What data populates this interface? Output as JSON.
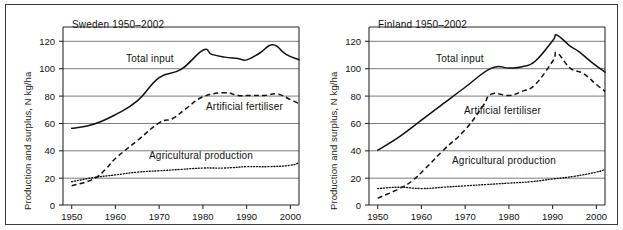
{
  "figure": {
    "background": "#ffffff",
    "frame_color": "#3a3a3a"
  },
  "panels": [
    {
      "id": "sweden",
      "title": "Sweden 1950–2002",
      "ylabel": "Production and surplus, N kg/ha",
      "series_labels": {
        "total_input": "Total input",
        "artificial_fertiliser": "Artificial fertiliser",
        "agricultural_production": "Agricultural production"
      },
      "yticks": [
        "0",
        "20",
        "40",
        "60",
        "80",
        "100",
        "120"
      ],
      "xticks": [
        "1950",
        "1960",
        "1970",
        "1980",
        "1990",
        "2000"
      ]
    },
    {
      "id": "finland",
      "title": "Finland 1950–2002",
      "ylabel": "Production and surplus, N kg/ha",
      "series_labels": {
        "total_input": "Total input",
        "artificial_fertiliser": "Artificial fertiliser",
        "agricultural_production": "Agricultural production"
      },
      "yticks": [
        "0",
        "20",
        "40",
        "60",
        "80",
        "100",
        "120"
      ],
      "xticks": [
        "1950",
        "1960",
        "1970",
        "1980",
        "1990",
        "2000"
      ]
    }
  ],
  "chart_data": [
    {
      "type": "line",
      "title": "Sweden 1950–2002",
      "xlabel": "",
      "ylabel": "Production and surplus, N kg/ha",
      "xlim": [
        1948,
        2002
      ],
      "ylim": [
        0,
        130
      ],
      "yticks": [
        0,
        20,
        40,
        60,
        80,
        100,
        120
      ],
      "xticks": [
        1950,
        1960,
        1970,
        1980,
        1990,
        2000
      ],
      "grid": "horizontal",
      "legend": "inline-annotations",
      "series": [
        {
          "name": "Total input",
          "style": "solid",
          "x": [
            1950,
            1955,
            1960,
            1965,
            1970,
            1975,
            1980,
            1982,
            1985,
            1988,
            1990,
            1993,
            1996,
            1999,
            2002
          ],
          "values": [
            56,
            59,
            66,
            76,
            93,
            99,
            113,
            110,
            108,
            107,
            106,
            111,
            117,
            110,
            106
          ]
        },
        {
          "name": "Artificial fertiliser",
          "style": "dashed",
          "x": [
            1950,
            1955,
            1958,
            1960,
            1965,
            1970,
            1973,
            1976,
            1980,
            1985,
            1988,
            1991,
            1994,
            1997,
            2000,
            2002
          ],
          "values": [
            14,
            19,
            27,
            34,
            47,
            60,
            63,
            70,
            79,
            82,
            80,
            80,
            80,
            81,
            77,
            74
          ]
        },
        {
          "name": "Agricultural production",
          "style": "dotted",
          "x": [
            1950,
            1955,
            1960,
            1965,
            1970,
            1975,
            1980,
            1985,
            1990,
            1995,
            2000,
            2002
          ],
          "values": [
            17,
            20,
            22,
            24,
            25,
            26,
            27,
            27,
            28,
            28,
            29,
            31
          ]
        }
      ]
    },
    {
      "type": "line",
      "title": "Finland 1950–2002",
      "xlabel": "",
      "ylabel": "Production and surplus, N kg/ha",
      "xlim": [
        1948,
        2002
      ],
      "ylim": [
        0,
        130
      ],
      "yticks": [
        0,
        20,
        40,
        60,
        80,
        100,
        120
      ],
      "xticks": [
        1950,
        1960,
        1970,
        1980,
        1990,
        2000
      ],
      "grid": "horizontal",
      "legend": "inline-annotations",
      "series": [
        {
          "name": "Total input",
          "style": "solid",
          "x": [
            1950,
            1955,
            1960,
            1965,
            1970,
            1976,
            1980,
            1983,
            1986,
            1990,
            1991,
            1994,
            1996,
            1999,
            2002
          ],
          "values": [
            40,
            50,
            62,
            74,
            86,
            100,
            100,
            101,
            105,
            120,
            124,
            116,
            112,
            104,
            97
          ]
        },
        {
          "name": "Artificial fertiliser",
          "style": "dashed",
          "x": [
            1950,
            1955,
            1958,
            1961,
            1965,
            1970,
            1974,
            1976,
            1980,
            1983,
            1986,
            1990,
            1991,
            1994,
            1997,
            2000,
            2002
          ],
          "values": [
            5,
            12,
            18,
            27,
            40,
            55,
            72,
            81,
            80,
            83,
            88,
            105,
            111,
            100,
            96,
            88,
            83
          ]
        },
        {
          "name": "Agricultural production",
          "style": "dotted",
          "x": [
            1950,
            1955,
            1960,
            1965,
            1970,
            1975,
            1980,
            1985,
            1990,
            1995,
            2000,
            2002
          ],
          "values": [
            12,
            13,
            12,
            13,
            14,
            15,
            16,
            17,
            19,
            21,
            24,
            26
          ]
        }
      ]
    }
  ]
}
